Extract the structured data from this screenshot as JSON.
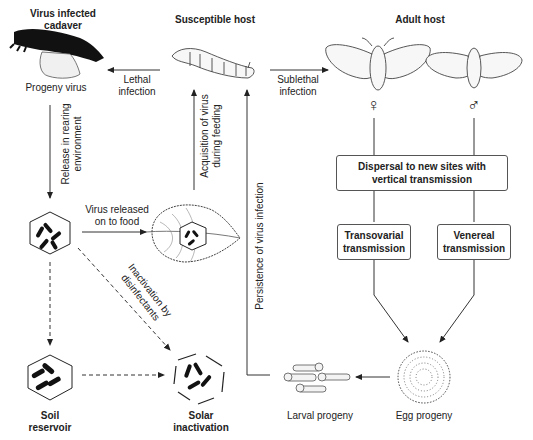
{
  "diagram": {
    "nodes": {
      "cadaver": {
        "title_line1": "Virus infected",
        "title_line2": "cadaver",
        "caption": "Progeny virus"
      },
      "susceptible_host": {
        "title": "Susceptible host"
      },
      "adult_host": {
        "title": "Adult host",
        "female_symbol": "♀",
        "male_symbol": "♂"
      },
      "dispersal_box": {
        "line1": "Dispersal to new sites with",
        "line2": "vertical transmission"
      },
      "transovarial_box": {
        "line1": "Transovarial",
        "line2": "transmission"
      },
      "venereal_box": {
        "line1": "Venereal",
        "line2": "transmission"
      },
      "soil_reservoir": {
        "line1": "Soil",
        "line2": "reservoir"
      },
      "solar_inactivation": {
        "line1": "Solar",
        "line2": "inactivation"
      },
      "larval_progeny": {
        "caption": "Larval progeny"
      },
      "egg_progeny": {
        "caption": "Egg progeny"
      }
    },
    "edges": {
      "lethal": {
        "line1": "Lethal",
        "line2": "infection"
      },
      "sublethal": {
        "line1": "Sublethal",
        "line2": "infection"
      },
      "release": {
        "line1": "Release in rearing",
        "line2": "environment"
      },
      "acquisition": {
        "line1": "Acquisition of virus",
        "line2": "during feeding"
      },
      "virus_food": {
        "line1": "Virus released",
        "line2": "on to food"
      },
      "inactivation": {
        "line1": "Inactivation by",
        "line2": "disinfectants"
      },
      "persistence": {
        "label": "Persistence of virus infection"
      }
    },
    "colors": {
      "line": "#333333",
      "text": "#222222",
      "box_border": "#555555",
      "fill_light": "#f2f2f2"
    }
  }
}
